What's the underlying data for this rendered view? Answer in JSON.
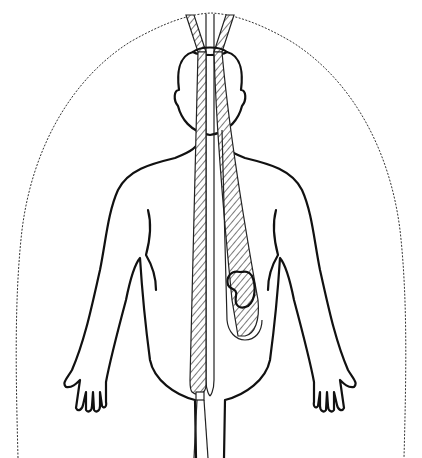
{
  "figure": {
    "colors": {
      "line": "#111111",
      "background": "#ffffff"
    },
    "elements": [
      {
        "name": "aura-outline",
        "shape": "wavy dome arc"
      },
      {
        "name": "body-outline",
        "shape": "human figure, arms at sides"
      },
      {
        "name": "head-band",
        "shape": "horizontal ring at crown"
      },
      {
        "name": "central-channel",
        "shape": "long vertical tube from crown to groin"
      },
      {
        "name": "hatched-left-channel",
        "shape": "hatched vertical band"
      },
      {
        "name": "hatched-right-channel",
        "shape": "diagonal hatched band ending at kidney loop"
      },
      {
        "name": "kidney-loop",
        "shape": "kidney shape inside rounded channel end"
      }
    ]
  }
}
